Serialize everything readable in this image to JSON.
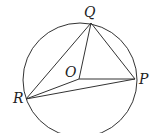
{
  "diagram": {
    "type": "circle-geometry",
    "circle": {
      "cx": 80,
      "cy": 80,
      "r": 57
    },
    "points": {
      "Q": {
        "label": "Q",
        "x": 91,
        "y": 23
      },
      "O": {
        "label": "O",
        "x": 79,
        "y": 79
      },
      "P": {
        "label": "P",
        "x": 135,
        "y": 79
      },
      "R": {
        "label": "R",
        "x": 26,
        "y": 99
      }
    },
    "segments": [
      "QR",
      "QO",
      "QP",
      "OP",
      "OR",
      "RP"
    ],
    "stroke_color": "#333333"
  }
}
